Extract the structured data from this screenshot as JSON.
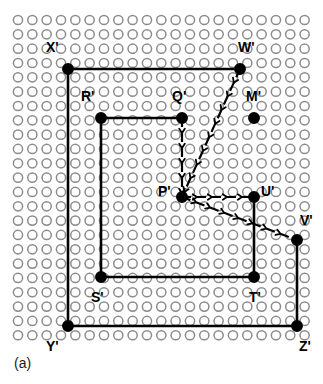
{
  "figure": {
    "caption": "(a)",
    "grid": {
      "cols": 21,
      "rows": 23,
      "origin_x": 18,
      "origin_y": 20,
      "spacing": 14.33,
      "circle_radius": 4.6,
      "circle_stroke": "#8c8c8c",
      "circle_fill": "#ffffff"
    },
    "colors": {
      "line": "#000000",
      "dot": "#000000",
      "text": "#000000",
      "caption": "#1a1a1a",
      "grid_circle": "#8c8c8c"
    },
    "points": [
      {
        "id": "X",
        "label": "X'",
        "x": 68,
        "y": 69,
        "label_dx": -22,
        "label_dy": -22,
        "filled": true
      },
      {
        "id": "W",
        "label": "W'",
        "x": 240,
        "y": 69,
        "label_dx": -2,
        "label_dy": -22,
        "filled": true
      },
      {
        "id": "R",
        "label": "R'",
        "x": 101,
        "y": 118,
        "label_dx": -20,
        "label_dy": -22,
        "filled": true
      },
      {
        "id": "Q",
        "label": "Q'",
        "x": 182,
        "y": 118,
        "label_dx": -10,
        "label_dy": -22,
        "filled": true
      },
      {
        "id": "M",
        "label": "M'",
        "x": 254,
        "y": 118,
        "label_dx": -8,
        "label_dy": -22,
        "filled": true
      },
      {
        "id": "P",
        "label": "P'",
        "x": 182,
        "y": 197,
        "label_dx": -24,
        "label_dy": -6,
        "filled": true
      },
      {
        "id": "U",
        "label": "U'",
        "x": 254,
        "y": 197,
        "label_dx": 7,
        "label_dy": -6,
        "filled": true
      },
      {
        "id": "V",
        "label": "V'",
        "x": 297,
        "y": 240,
        "label_dx": 3,
        "label_dy": -20,
        "filled": true
      },
      {
        "id": "S",
        "label": "S'",
        "x": 101,
        "y": 277,
        "label_dx": -10,
        "label_dy": 20,
        "filled": true
      },
      {
        "id": "T",
        "label": "T'",
        "x": 254,
        "y": 277,
        "label_dx": -5,
        "label_dy": 20,
        "filled": true
      },
      {
        "id": "Y",
        "label": "Y'",
        "x": 68,
        "y": 326,
        "label_dx": -22,
        "label_dy": 20,
        "filled": true
      },
      {
        "id": "Z",
        "label": "Z'",
        "x": 297,
        "y": 326,
        "label_dx": 2,
        "label_dy": 20,
        "filled": true
      }
    ],
    "solid_edges": [
      {
        "name": "edge-X-W",
        "from": "X",
        "to": "W"
      },
      {
        "name": "edge-X-Y",
        "from": "X",
        "to": "Y"
      },
      {
        "name": "edge-Y-Z",
        "from": "Y",
        "to": "Z"
      },
      {
        "name": "edge-Z-V",
        "from": "Z",
        "to": "V"
      },
      {
        "name": "edge-R-Q",
        "from": "R",
        "to": "Q"
      },
      {
        "name": "edge-R-S",
        "from": "R",
        "to": "S"
      },
      {
        "name": "edge-S-T",
        "from": "S",
        "to": "T"
      },
      {
        "name": "edge-T-U",
        "from": "T",
        "to": "U"
      }
    ],
    "dashed_arrows": [
      {
        "name": "arrow-Q-P",
        "from": "Q",
        "to": "P"
      },
      {
        "name": "arrow-P-U",
        "from": "P",
        "to": "U"
      },
      {
        "name": "arrow-W-P",
        "from": "W",
        "to": "P"
      },
      {
        "name": "arrow-P-V",
        "from": "P",
        "to": "V"
      }
    ]
  }
}
